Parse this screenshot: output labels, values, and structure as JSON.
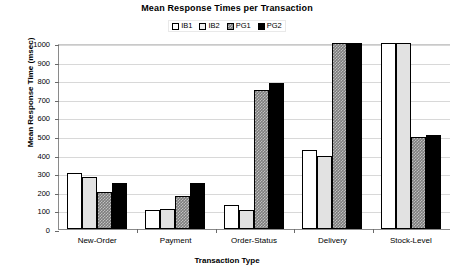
{
  "chart_data": {
    "type": "bar",
    "title": "Mean Response Times per Transaction",
    "xlabel": "Transaction Type",
    "ylabel": "Mean Response Time (msec)",
    "categories": [
      "New-Order",
      "Payment",
      "Order-Status",
      "Delivery",
      "Stock-Level"
    ],
    "series": [
      {
        "name": "IB1",
        "values": [
          300,
          100,
          130,
          425,
          1000
        ]
      },
      {
        "name": "IB2",
        "values": [
          280,
          110,
          100,
          390,
          1000
        ]
      },
      {
        "name": "PG1",
        "values": [
          200,
          180,
          745,
          1000,
          495
        ]
      },
      {
        "name": "PG2",
        "values": [
          250,
          250,
          785,
          1000,
          505
        ]
      }
    ],
    "ylim": [
      0,
      1000
    ],
    "ytick_labels": [
      "1000",
      "900",
      "800",
      "700",
      "600",
      "500",
      "400",
      "300",
      "200",
      "100",
      "0"
    ],
    "ytick_values": [
      1000,
      900,
      800,
      700,
      600,
      500,
      400,
      300,
      200,
      100,
      0
    ],
    "grid": true,
    "legend_position": "top-center",
    "series_colors": [
      "#ffffff",
      "#e2e2e2",
      "#7d7d7d",
      "#000000"
    ],
    "clipped_note": "Bars reaching 1000 are clipped at the axis maximum"
  }
}
